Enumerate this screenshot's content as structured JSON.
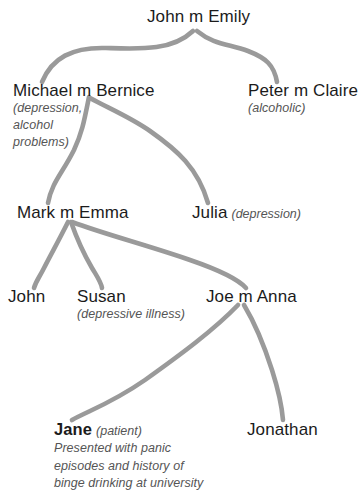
{
  "diagram": {
    "type": "family-tree-genogram",
    "line_color": "#9a9a9a",
    "name_color": "#1b1b1b",
    "note_color": "#555555",
    "background": "#ffffff"
  },
  "generations": [
    {
      "level": 1,
      "people": [
        {
          "id": "john-emily",
          "name": "John m Emily",
          "notes": []
        }
      ]
    },
    {
      "level": 2,
      "people": [
        {
          "id": "michael-bernice",
          "name": "Michael m Bernice",
          "notes": [
            "(depression,",
            "alcohol",
            "problems)"
          ]
        },
        {
          "id": "peter-claire",
          "name": "Peter m Claire",
          "notes": [
            "(alcoholic)"
          ]
        }
      ]
    },
    {
      "level": 3,
      "people": [
        {
          "id": "mark-emma",
          "name": "Mark m Emma",
          "notes": []
        },
        {
          "id": "julia",
          "name": "Julia",
          "inline_note": "(depression)",
          "notes": []
        }
      ]
    },
    {
      "level": 4,
      "people": [
        {
          "id": "john-jr",
          "name": "John",
          "notes": []
        },
        {
          "id": "susan",
          "name": "Susan",
          "notes": [
            "(depressive illness)"
          ]
        },
        {
          "id": "joe-anna",
          "name": "Joe m Anna",
          "notes": []
        }
      ]
    },
    {
      "level": 5,
      "people": [
        {
          "id": "jane",
          "name": "Jane",
          "inline_note": "(patient)",
          "is_patient": true,
          "description": [
            "Presented with panic",
            "episodes and history of",
            "binge drinking at university"
          ]
        },
        {
          "id": "jonathan",
          "name": "Jonathan",
          "notes": []
        }
      ]
    }
  ],
  "nodes": {
    "john_emily": {
      "name": "John m Emily"
    },
    "michael_bernice": {
      "name": "Michael m Bernice",
      "note1": "(depression,",
      "note2": "alcohol",
      "note3": "problems)"
    },
    "peter_claire": {
      "name": "Peter m Claire",
      "note1": "(alcoholic)"
    },
    "mark_emma": {
      "name": "Mark m Emma"
    },
    "julia": {
      "name": "Julia",
      "note": "(depression)"
    },
    "john_jr": {
      "name": "John"
    },
    "susan": {
      "name": "Susan",
      "note": "(depressive illness)"
    },
    "joe_anna": {
      "name": "Joe m Anna"
    },
    "jane": {
      "name": "Jane",
      "note": "(patient)",
      "desc1": "Presented with panic",
      "desc2": "episodes and history of",
      "desc3": "binge drinking at university"
    },
    "jonathan": {
      "name": "Jonathan"
    }
  },
  "connections": [
    {
      "id": "john-emily-to-michael",
      "from": "john_emily",
      "to": "michael_bernice"
    },
    {
      "id": "john-emily-to-peter",
      "from": "john_emily",
      "to": "peter_claire"
    },
    {
      "id": "michael-to-mark",
      "from": "michael_bernice",
      "to": "mark_emma"
    },
    {
      "id": "michael-to-julia",
      "from": "michael_bernice",
      "to": "julia"
    },
    {
      "id": "mark-to-john",
      "from": "mark_emma",
      "to": "john_jr"
    },
    {
      "id": "mark-to-susan",
      "from": "mark_emma",
      "to": "susan"
    },
    {
      "id": "mark-to-joe",
      "from": "mark_emma",
      "to": "joe_anna"
    },
    {
      "id": "joe-to-jane",
      "from": "joe_anna",
      "to": "jane"
    },
    {
      "id": "joe-to-jonathan",
      "from": "joe_anna",
      "to": "jonathan"
    }
  ]
}
